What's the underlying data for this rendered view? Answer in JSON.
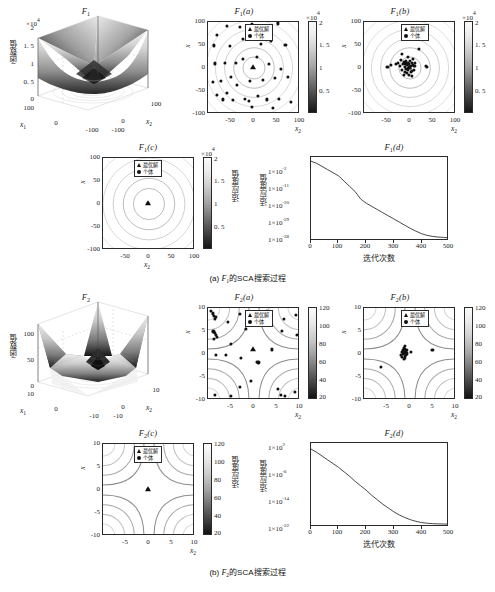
{
  "figure": {
    "captions": [
      {
        "index": "(a)",
        "func": "F",
        "sub": "1",
        "text": "的SCA搜索过程"
      },
      {
        "index": "(b)",
        "func": "F",
        "sub": "2",
        "text": "的SCA搜索过程"
      }
    ],
    "legend": {
      "optimal": "最优解",
      "individual": "个体"
    },
    "labels": {
      "func_value": "函数值",
      "fitness_value": "适应度值",
      "iterations": "迭代次数",
      "x1": "x",
      "x1sub": "1",
      "x2": "x",
      "x2sub": "2"
    }
  },
  "chart_data": [
    {
      "id": "F1-surface",
      "type": "surface",
      "title": "F_1",
      "title_main": "F",
      "title_sub": "1",
      "title_paren": "",
      "xlabel": "x1",
      "ylabel": "x2",
      "zlabel": "函数值",
      "z_multiplier": "×10⁴",
      "zticks": [
        "0",
        "0. 5",
        "1",
        "1. 5",
        "2"
      ],
      "zlim": [
        0,
        20000
      ],
      "xticks": [
        "-100",
        "0",
        "100"
      ],
      "yticks": [
        "-100",
        "0",
        "100"
      ],
      "xlim": [
        -100,
        100
      ],
      "ylim": [
        -100,
        100
      ],
      "description": "Sphere-like bowl function surface over [-100,100]^2"
    },
    {
      "id": "F1-a",
      "type": "scatter-contour",
      "title_main": "F",
      "title_sub": "1",
      "title_paren": "(a)",
      "xlabel": "x2",
      "ylabel": "x1",
      "xticks": [
        -100,
        -50,
        0,
        50,
        100
      ],
      "yticks": [
        -100,
        -50,
        0,
        50,
        100
      ],
      "xlim": [
        -100,
        100
      ],
      "ylim": [
        -100,
        100
      ],
      "colorbar": {
        "multiplier": "×10⁴",
        "ticks": [
          "0. 5",
          "1",
          "1. 5",
          "2"
        ],
        "min": 0,
        "max": 20000
      },
      "best": [
        0,
        0
      ],
      "points": [
        [
          -80,
          72
        ],
        [
          -58,
          92
        ],
        [
          -30,
          90
        ],
        [
          -3,
          95
        ],
        [
          28,
          92
        ],
        [
          55,
          97
        ],
        [
          -86,
          48
        ],
        [
          -52,
          47
        ],
        [
          -22,
          62
        ],
        [
          18,
          52
        ],
        [
          40,
          58
        ],
        [
          72,
          50
        ],
        [
          -84,
          8
        ],
        [
          -62,
          10
        ],
        [
          -38,
          10
        ],
        [
          -22,
          18
        ],
        [
          8,
          22
        ],
        [
          36,
          6
        ],
        [
          62,
          -4
        ],
        [
          -90,
          -34
        ],
        [
          -72,
          -30
        ],
        [
          -50,
          -22
        ],
        [
          -36,
          -40
        ],
        [
          -6,
          -30
        ],
        [
          22,
          -28
        ],
        [
          48,
          -24
        ],
        [
          78,
          -22
        ],
        [
          -80,
          -62
        ],
        [
          -66,
          -72
        ],
        [
          -58,
          -58
        ],
        [
          -44,
          -74
        ],
        [
          -18,
          -70
        ],
        [
          -10,
          -76
        ],
        [
          10,
          -64
        ],
        [
          30,
          -72
        ],
        [
          58,
          -70
        ],
        [
          85,
          -78
        ],
        [
          -2,
          -88
        ],
        [
          45,
          -90
        ]
      ]
    },
    {
      "id": "F1-b",
      "type": "scatter-contour",
      "title_main": "F",
      "title_sub": "1",
      "title_paren": "(b)",
      "xlabel": "x2",
      "ylabel": "x1",
      "xticks": [
        -100,
        -50,
        0,
        50,
        100
      ],
      "yticks": [
        -100,
        -50,
        0,
        50,
        100
      ],
      "xlim": [
        -100,
        100
      ],
      "ylim": [
        -100,
        100
      ],
      "colorbar": {
        "multiplier": "×10⁴",
        "ticks": [
          "0. 5",
          "1",
          "1. 5",
          "2"
        ],
        "min": 0,
        "max": 20000
      },
      "best": [
        0,
        0
      ],
      "points": [
        [
          -48,
          0
        ],
        [
          -40,
          4
        ],
        [
          22,
          40
        ],
        [
          -16,
          30
        ],
        [
          40,
          0
        ],
        [
          38,
          2
        ],
        [
          -12,
          12
        ],
        [
          -8,
          8
        ],
        [
          -6,
          14
        ],
        [
          -4,
          4
        ],
        [
          -2,
          10
        ],
        [
          0,
          6
        ],
        [
          2,
          14
        ],
        [
          4,
          2
        ],
        [
          6,
          10
        ],
        [
          8,
          4
        ],
        [
          -10,
          0
        ],
        [
          -14,
          6
        ],
        [
          -6,
          -4
        ],
        [
          -2,
          -6
        ],
        [
          2,
          -2
        ],
        [
          6,
          -8
        ],
        [
          -10,
          -10
        ],
        [
          -4,
          -14
        ],
        [
          0,
          -18
        ],
        [
          4,
          -10
        ],
        [
          10,
          -6
        ],
        [
          12,
          2
        ],
        [
          -16,
          -6
        ],
        [
          -20,
          2
        ],
        [
          -24,
          10
        ],
        [
          14,
          10
        ],
        [
          -30,
          6
        ],
        [
          -18,
          16
        ],
        [
          8,
          18
        ],
        [
          -2,
          22
        ],
        [
          -12,
          -18
        ],
        [
          6,
          -20
        ]
      ]
    },
    {
      "id": "F1-c",
      "type": "scatter-contour",
      "title_main": "F",
      "title_sub": "1",
      "title_paren": "(c)",
      "xlabel": "x2",
      "ylabel": "x1",
      "xticks": [
        -50,
        0,
        50,
        100
      ],
      "yticks": [
        -100,
        -50,
        0,
        50,
        100
      ],
      "xlim": [
        -100,
        100
      ],
      "ylim": [
        -100,
        100
      ],
      "colorbar": {
        "multiplier": "×10⁴",
        "ticks": [
          "0. 5",
          "1",
          "1. 5",
          "2"
        ],
        "min": 0,
        "max": 20000,
        "label": "适应度值"
      },
      "best": [
        0,
        0
      ],
      "points": [
        [
          0,
          0
        ]
      ]
    },
    {
      "id": "F1-d",
      "type": "line",
      "title_main": "F",
      "title_sub": "1",
      "title_paren": "(d)",
      "xlabel": "迭代次数",
      "ylabel": "适应度值",
      "xticks": [
        0,
        100,
        200,
        300,
        400,
        500
      ],
      "yticks": [
        "1×10⁻²",
        "1×10⁻¹¹",
        "1×10⁻²⁰",
        "1×10⁻²⁹",
        "1×10⁻³⁸"
      ],
      "ytick_mantissa": "1×10",
      "ytick_exponents": [
        "-2",
        "-11",
        "-20",
        "-29",
        "-38"
      ],
      "xlim": [
        0,
        500
      ],
      "log_scale": true,
      "x": [
        0,
        20,
        40,
        60,
        80,
        100,
        120,
        140,
        160,
        180,
        200,
        220,
        240,
        260,
        280,
        300,
        320,
        340,
        360,
        380,
        400,
        420,
        440,
        460,
        480,
        500
      ],
      "y_exponent": [
        -1.5,
        -2.5,
        -4.0,
        -5.5,
        -7.0,
        -8.5,
        -11.0,
        -13.5,
        -16.0,
        -19.5,
        -21.5,
        -23.0,
        -24.5,
        -26.0,
        -27.5,
        -29.0,
        -30.5,
        -32.0,
        -33.5,
        -34.8,
        -36.0,
        -36.8,
        -37.3,
        -37.6,
        -37.8,
        -38.0
      ]
    },
    {
      "id": "F2-surface",
      "type": "surface",
      "title_main": "F",
      "title_sub": "2",
      "title_paren": "",
      "xlabel": "x1",
      "ylabel": "x2",
      "zlabel": "函数值",
      "zticks": [
        "0",
        "50",
        "100"
      ],
      "zlim": [
        0,
        120
      ],
      "xticks": [
        "-10",
        "0",
        "10"
      ],
      "yticks": [
        "-10",
        "0",
        "10"
      ],
      "xlim": [
        -10,
        10
      ],
      "ylim": [
        -10,
        10
      ],
      "description": "Schwefel 2.22-like function surface over [-10,10]^2"
    },
    {
      "id": "F2-a",
      "type": "scatter-contour",
      "title_main": "F",
      "title_sub": "2",
      "title_paren": "(a)",
      "xlabel": "x2",
      "ylabel": "x1",
      "xticks": [
        -5,
        0,
        5,
        10
      ],
      "yticks": [
        -10,
        -5,
        0,
        5,
        10
      ],
      "xlim": [
        -10,
        10
      ],
      "ylim": [
        -10,
        10
      ],
      "colorbar": {
        "ticks": [
          20,
          40,
          60,
          80,
          100,
          120
        ],
        "min": 20,
        "max": 120
      },
      "best": [
        0,
        1
      ],
      "points": [
        [
          -9.3,
          9.4
        ],
        [
          -8.9,
          8.8
        ],
        [
          -8.6,
          8.3
        ],
        [
          -8.2,
          8.0
        ],
        [
          -8.5,
          7.6
        ],
        [
          -8.8,
          4.8
        ],
        [
          -8.5,
          4.4
        ],
        [
          -8.3,
          4.0
        ],
        [
          -8.0,
          3.6
        ],
        [
          -8.6,
          3.2
        ],
        [
          -8.2,
          -0.4
        ],
        [
          -5.6,
          7.0
        ],
        [
          -3.0,
          8.6
        ],
        [
          -1.0,
          9.2
        ],
        [
          3.0,
          9.3
        ],
        [
          3.4,
          8.8
        ],
        [
          6.8,
          7.5
        ],
        [
          9.6,
          8.4
        ],
        [
          -1.5,
          5.4
        ],
        [
          6.5,
          5.0
        ],
        [
          9.8,
          4.1
        ],
        [
          -5.0,
          2.0
        ],
        [
          4.2,
          0.8
        ],
        [
          -6.0,
          -0.5
        ],
        [
          -2.6,
          -1.0
        ],
        [
          0.8,
          -2.0
        ],
        [
          1.2,
          -2.1
        ],
        [
          -0.5,
          -6.2
        ],
        [
          -3.0,
          -7.5
        ],
        [
          5.6,
          -8.0
        ],
        [
          6.2,
          -9.3
        ],
        [
          7.0,
          -9.5
        ],
        [
          9.3,
          -8.6
        ],
        [
          -8.4,
          -9.3
        ],
        [
          -5.0,
          -9.6
        ]
      ]
    },
    {
      "id": "F2-b",
      "type": "scatter-contour",
      "title_main": "F",
      "title_sub": "2",
      "title_paren": "(b)",
      "xlabel": "x2",
      "ylabel": "x1",
      "xticks": [
        -5,
        0,
        5,
        10
      ],
      "yticks": [
        -10,
        -5,
        0,
        5,
        10
      ],
      "xlim": [
        -10,
        10
      ],
      "ylim": [
        -10,
        10
      ],
      "colorbar": {
        "ticks": [
          20,
          40,
          60,
          80,
          100,
          120
        ],
        "min": 20,
        "max": 120
      },
      "best": [
        -1,
        0.2
      ],
      "points": [
        [
          -1.2,
          1.1
        ],
        [
          -0.9,
          0.9
        ],
        [
          -1.4,
          0.6
        ],
        [
          -0.7,
          0.5
        ],
        [
          -1.1,
          0.2
        ],
        [
          -0.8,
          0.0
        ],
        [
          -1.3,
          -0.2
        ],
        [
          -0.6,
          -0.4
        ],
        [
          -1.0,
          -0.6
        ],
        [
          -1.5,
          -0.8
        ],
        [
          -0.9,
          -1.1
        ],
        [
          -1.2,
          -1.4
        ],
        [
          -0.5,
          -0.1
        ],
        [
          -1.6,
          0.3
        ],
        [
          -0.4,
          0.7
        ],
        [
          0.5,
          0.2
        ],
        [
          5.2,
          0.6
        ],
        [
          -6.3,
          -3.0
        ],
        [
          -1.0,
          1.5
        ],
        [
          -1.8,
          -0.4
        ]
      ]
    },
    {
      "id": "F2-c",
      "type": "scatter-contour",
      "title_main": "F",
      "title_sub": "2",
      "title_paren": "(c)",
      "xlabel": "x2",
      "ylabel": "x1",
      "xticks": [
        -5,
        0,
        5,
        10
      ],
      "yticks": [
        -10,
        -5,
        0,
        5,
        10
      ],
      "xlim": [
        -10,
        10
      ],
      "ylim": [
        -10,
        10
      ],
      "colorbar": {
        "ticks": [
          20,
          40,
          60,
          80,
          100,
          120
        ],
        "min": 20,
        "max": 120,
        "label": "适应度值"
      },
      "best": [
        0,
        0
      ],
      "points": [
        [
          0,
          0
        ]
      ]
    },
    {
      "id": "F2-d",
      "type": "line",
      "title_main": "F",
      "title_sub": "2",
      "title_paren": "(d)",
      "xlabel": "迭代次数",
      "ylabel": "适应度值",
      "xticks": [
        0,
        100,
        200,
        300,
        400,
        500
      ],
      "ytick_mantissa": "1×10",
      "ytick_exponents": [
        "2",
        "-6",
        "-14",
        "-22"
      ],
      "xlim": [
        0,
        500
      ],
      "log_scale": true,
      "x": [
        0,
        20,
        40,
        60,
        80,
        100,
        120,
        140,
        160,
        180,
        200,
        220,
        240,
        260,
        280,
        300,
        320,
        340,
        360,
        380,
        400,
        420,
        440,
        460,
        480,
        500
      ],
      "y_exponent": [
        1.6,
        0.6,
        -0.6,
        -1.8,
        -3.0,
        -4.2,
        -5.6,
        -7.0,
        -8.6,
        -10.0,
        -11.4,
        -13.0,
        -14.4,
        -15.8,
        -17.0,
        -18.2,
        -19.2,
        -20.0,
        -20.7,
        -21.2,
        -21.6,
        -21.8,
        -21.95,
        -22.0,
        -22.05,
        -22.1
      ]
    }
  ]
}
